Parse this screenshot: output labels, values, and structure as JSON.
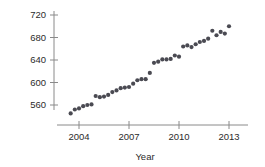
{
  "chart_data": {
    "type": "scatter",
    "title": "",
    "xlabel": "Year",
    "ylabel": "Women's Weekly Earnings",
    "xlim": [
      2003.2,
      2014.0
    ],
    "ylim": [
      540,
      726
    ],
    "grid": false,
    "legend": "none",
    "xticks": [
      2004,
      2007,
      2010,
      2013
    ],
    "xtick_labels": [
      "2004",
      "2007",
      "2010",
      "2013"
    ],
    "yticks": [
      560,
      600,
      640,
      680,
      720
    ],
    "ytick_labels": [
      "560",
      "600",
      "640",
      "680",
      "720"
    ],
    "marker_color": "#4a4a52",
    "axis_color": "#8a8a8a",
    "series": [
      {
        "name": "Women's Weekly Earnings",
        "x": [
          2003.5,
          2003.75,
          2004.0,
          2004.25,
          2004.5,
          2004.75,
          2005.0,
          2005.25,
          2005.5,
          2005.75,
          2006.0,
          2006.25,
          2006.5,
          2006.75,
          2007.0,
          2007.25,
          2007.5,
          2007.75,
          2008.0,
          2008.25,
          2008.5,
          2008.75,
          2009.0,
          2009.25,
          2009.5,
          2009.75,
          2010.0,
          2010.25,
          2010.5,
          2010.75,
          2011.0,
          2011.25,
          2011.5,
          2011.75,
          2012.0,
          2012.25,
          2012.5,
          2012.75,
          2013.0
        ],
        "y": [
          545,
          552,
          554,
          558,
          560,
          561,
          576,
          574,
          575,
          578,
          583,
          586,
          590,
          591,
          592,
          598,
          604,
          606,
          606,
          617,
          635,
          637,
          641,
          641,
          642,
          648,
          646,
          664,
          666,
          663,
          668,
          672,
          674,
          678,
          692,
          684,
          690,
          687,
          700
        ]
      }
    ]
  }
}
